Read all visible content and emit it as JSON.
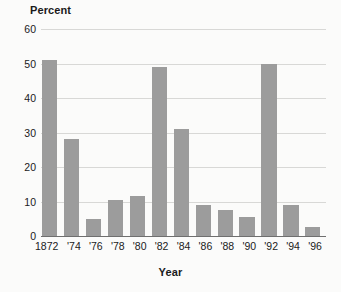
{
  "chart_data": {
    "type": "bar",
    "title": "",
    "xlabel": "Year",
    "ylabel": "Percent",
    "categories": [
      "1872",
      "'74",
      "'76",
      "'78",
      "'80",
      "'82",
      "'84",
      "'86",
      "'88",
      "'90",
      "'92",
      "'94",
      "'96"
    ],
    "values": [
      51,
      28,
      5,
      10.5,
      11.5,
      49,
      31,
      9,
      7.5,
      5.5,
      50,
      9,
      2.5
    ],
    "ylim": [
      0,
      60
    ],
    "yticks": [
      0,
      10,
      20,
      30,
      40,
      50,
      60
    ],
    "ytick_labels": [
      "0",
      "10",
      "20",
      "30",
      "40",
      "50",
      "60"
    ],
    "grid": true,
    "legend": null,
    "series": [
      {
        "name": "Percent",
        "values": [
          51,
          28,
          5,
          10.5,
          11.5,
          49,
          31,
          9,
          7.5,
          5.5,
          50,
          9,
          2.5
        ]
      }
    ],
    "colors": {
      "bar_fill": "#9c9c9c",
      "gridline": "#d8d8d6",
      "axis_line": "#6f6f6f",
      "text": "#1a1a1a",
      "background": "#fbfbfa"
    }
  },
  "watermark": {
    "text": ""
  }
}
